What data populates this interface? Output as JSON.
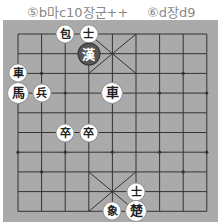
{
  "caption": {
    "move5": "⑤b마c10장군++",
    "move6": "⑥d장d9"
  },
  "board": {
    "columns": 9,
    "rows": 10,
    "colors": {
      "background": "#aaaaaa",
      "line": "#333333",
      "piece": "#ffffff",
      "dark_piece": "#555555"
    },
    "pieces": [
      {
        "label": "包",
        "side": "green",
        "col": 2,
        "row": 0
      },
      {
        "label": "士",
        "side": "green",
        "col": 3,
        "row": 0
      },
      {
        "label": "漢",
        "side": "red-general",
        "col": 3,
        "row": 1,
        "dark": true
      },
      {
        "label": "車",
        "side": "green",
        "col": 0,
        "row": 2
      },
      {
        "label": "馬",
        "side": "green",
        "col": 0,
        "row": 3,
        "big": true
      },
      {
        "label": "兵",
        "side": "green",
        "col": 1,
        "row": 3
      },
      {
        "label": "車",
        "side": "red",
        "col": 4,
        "row": 3,
        "big": true
      },
      {
        "label": "卒",
        "side": "green",
        "col": 2,
        "row": 5
      },
      {
        "label": "卒",
        "side": "green",
        "col": 3,
        "row": 5
      },
      {
        "label": "士",
        "side": "green",
        "col": 5,
        "row": 8
      },
      {
        "label": "象",
        "side": "green",
        "col": 4,
        "row": 9
      },
      {
        "label": "楚",
        "side": "green-general",
        "col": 5,
        "row": 9,
        "big": true
      }
    ]
  }
}
